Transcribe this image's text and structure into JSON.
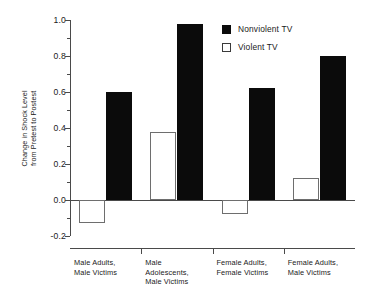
{
  "chart_data": {
    "type": "bar",
    "title": "",
    "xlabel": "",
    "ylabel": "Change in Shock Level from Pretest to Postest",
    "ylabel_lines": [
      "Change in Shock Level",
      "from Pretest to Postest"
    ],
    "ylim": [
      -0.2,
      1.0
    ],
    "ytick_values": [
      -0.2,
      0.0,
      0.2,
      0.4,
      0.6,
      0.8,
      1.0
    ],
    "ytick_labels": [
      "-0.2",
      "0.0",
      "0.2",
      "0.4",
      "0.6",
      "0.8",
      "1.0"
    ],
    "yminor_values": [
      -0.1,
      0.1,
      0.3,
      0.5,
      0.7,
      0.9
    ],
    "grid": false,
    "legend_position": "top-right",
    "categories": [
      "Male Adults, Male Victims",
      "Male Adolescents, Male Victims",
      "Female Adults, Female Victims",
      "Female Adults, Male Victims"
    ],
    "category_label_lines": [
      [
        "Male Adults,",
        "Male Victims"
      ],
      [
        "Male",
        "Adolescents,",
        "Male Victims"
      ],
      [
        "Female Adults,",
        "Female Victims"
      ],
      [
        "Female Adults,",
        "Male Victims"
      ]
    ],
    "series": [
      {
        "name": "Violent TV",
        "style": "open",
        "color": "#ffffff",
        "edge_color": "#6e6e6e",
        "values": [
          -0.13,
          0.38,
          -0.08,
          0.12
        ]
      },
      {
        "name": "Nonviolent TV",
        "style": "filled",
        "color": "#0b0b0b",
        "edge_color": "#0b0b0b",
        "values": [
          0.6,
          0.98,
          0.62,
          0.8
        ]
      }
    ]
  },
  "legend": {
    "entries": [
      {
        "label": "Nonviolent TV",
        "style": "filled"
      },
      {
        "label": "Violent TV",
        "style": "open"
      }
    ]
  },
  "colors": {
    "axis": "#4a4a4a",
    "filled_bar": "#0b0b0b",
    "open_bar_edge": "#6e6e6e",
    "background": "#ffffff"
  }
}
